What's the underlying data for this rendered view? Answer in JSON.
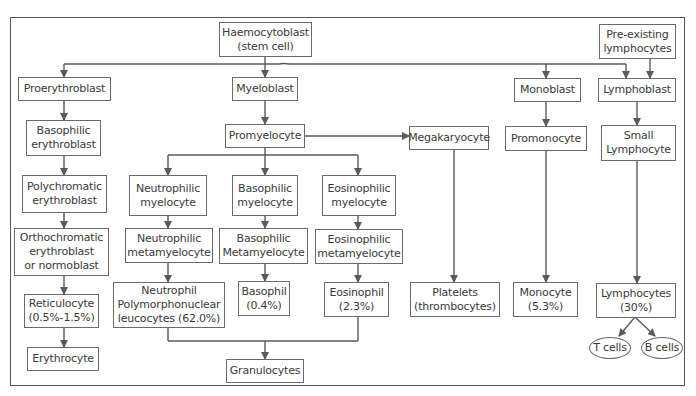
{
  "diagram": {
    "line_color": "#5a5a5a",
    "nodes": {
      "haemocytoblast": {
        "line1": "Haemocytoblast",
        "line2": "(stem cell)"
      },
      "preexisting": {
        "line1": "Pre-existing",
        "line2": "lymphocytes"
      },
      "proerythroblast": {
        "line1": "Proerythroblast"
      },
      "myeloblast": {
        "line1": "Myeloblast"
      },
      "monoblast": {
        "line1": "Monoblast"
      },
      "lymphoblast": {
        "line1": "Lymphoblast"
      },
      "basophilic_erythroblast": {
        "line1": "Basophilic",
        "line2": "erythroblast"
      },
      "promyelocyte": {
        "line1": "Promyelocyte"
      },
      "megakaryocyte": {
        "line1": "Megakaryocyte"
      },
      "promonocyte": {
        "line1": "Promonocyte"
      },
      "small_lymphocyte": {
        "line1": "Small",
        "line2": "Lymphocyte"
      },
      "polychromatic_erythroblast": {
        "line1": "Polychromatic",
        "line2": "erythroblast"
      },
      "neutrophilic_myelocyte": {
        "line1": "Neutrophilic",
        "line2": "myelocyte"
      },
      "basophilic_myelocyte": {
        "line1": "Basophilic",
        "line2": "myelocyte"
      },
      "eosinophilic_myelocyte": {
        "line1": "Eosinophilic",
        "line2": "myelocyte"
      },
      "orthochromatic": {
        "line1": "Orthochromatic",
        "line2": "erythroblast",
        "line3": "or normoblast"
      },
      "neutrophilic_metamyelocyte": {
        "line1": "Neutrophilic",
        "line2": "metamyelocyte"
      },
      "basophilic_metamyelocyte": {
        "line1": "Basophilic",
        "line2": "Metamyelocyte"
      },
      "eosinophilic_metamyelocyte": {
        "line1": "Eosinophilic",
        "line2": "metamyelocyte"
      },
      "reticulocyte": {
        "line1": "Reticulocyte",
        "line2": "(0.5%-1.5%)"
      },
      "neutrophil": {
        "line1": "Neutrophil",
        "line2": "Polymorphonuclear",
        "line3": "leucocytes (62.0%)"
      },
      "basophil": {
        "line1": "Basophil",
        "line2": "(0.4%)"
      },
      "eosinophil": {
        "line1": "Eosinophil",
        "line2": "(2.3%)"
      },
      "platelets": {
        "line1": "Platelets",
        "line2": "(thrombocytes)"
      },
      "monocyte": {
        "line1": "Monocyte",
        "line2": "(5.3%)"
      },
      "lymphocytes": {
        "line1": "Lymphocytes",
        "line2": "(30%)"
      },
      "erythrocyte": {
        "line1": "Erythrocyte"
      },
      "granulocytes": {
        "line1": "Granulocytes"
      },
      "t_cells": {
        "line1": "T cells"
      },
      "b_cells": {
        "line1": "B cells"
      }
    }
  }
}
